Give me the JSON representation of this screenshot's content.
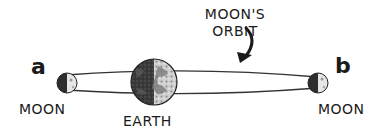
{
  "diagram": {
    "title_caption": {
      "line1": "MOON'S",
      "line2": "ORBIT"
    },
    "positions": [
      {
        "id": "a",
        "label": "a",
        "object_label": "MOON"
      },
      {
        "id": "b",
        "label": "b",
        "object_label": "MOON"
      }
    ],
    "center_body": {
      "label": "EARTH"
    },
    "colors": {
      "ink": "#1a1a1a",
      "orbit_line": "#333333",
      "earth_dark": "#3a3a3a",
      "earth_light": "#d8d8d8",
      "moon_dark": "#2e2e2e",
      "moon_light": "#e6e6e6"
    }
  }
}
